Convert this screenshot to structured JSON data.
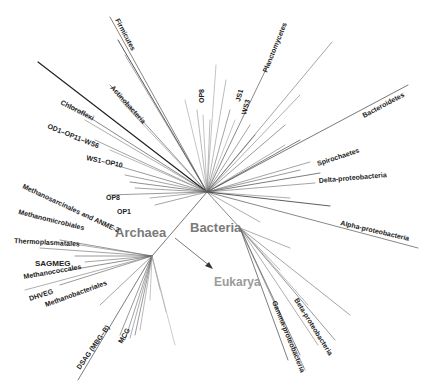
{
  "diagram": {
    "type": "unrooted phylogenetic tree",
    "domains": [
      {
        "name": "Bacteria",
        "label": "Bacteria"
      },
      {
        "name": "Archaea",
        "label": "Archaea"
      },
      {
        "name": "Eukarya",
        "label": "Eukarya"
      }
    ],
    "bacteria_groups": [
      {
        "label": "Firmicutes"
      },
      {
        "label": "Actinobacteria"
      },
      {
        "label": "Chloroflexi"
      },
      {
        "label": "OD1–OP11–WS6"
      },
      {
        "label": "WS1–OP10"
      },
      {
        "label": "OP8"
      },
      {
        "label": "OP1"
      },
      {
        "label": "OP8"
      },
      {
        "label": "JS1"
      },
      {
        "label": "WS3"
      },
      {
        "label": "Planctomycetes"
      },
      {
        "label": "Bacteroidetes"
      },
      {
        "label": "Spirochaetes"
      },
      {
        "label": "Delta-proteobacteria"
      },
      {
        "label": "Alpha-proteobacteria"
      },
      {
        "label": "Beta-proteobacteria"
      },
      {
        "label": "Gamma-proteobacteria"
      }
    ],
    "archaea_groups": [
      {
        "label": "Methanosarcinales and ANME-2"
      },
      {
        "label": "Methanomicrobiales"
      },
      {
        "label": "Thermoplasmatales"
      },
      {
        "label": "SAGMEG"
      },
      {
        "label": "Methanococcales"
      },
      {
        "label": "DHVEG"
      },
      {
        "label": "Methanobacteriales"
      },
      {
        "label": "DSAG (MBG–B)"
      },
      {
        "label": "MCG"
      }
    ],
    "colors": {
      "branch": "#555555",
      "branch_dark": "#222222",
      "domain_label": "#7a7a7a",
      "eukarya_label": "#9a9a9a",
      "group_label": "#222222"
    }
  }
}
